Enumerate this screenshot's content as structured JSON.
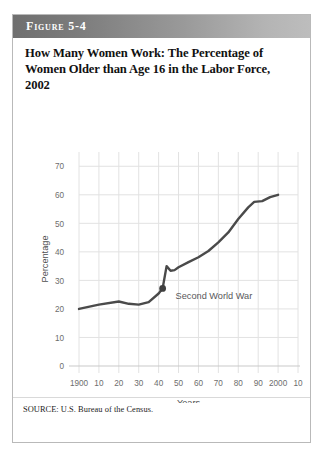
{
  "figure": {
    "number_label": "Figure 5-4",
    "title": "How Many Women Work: The Percentage of Women Older than Age 16 in the Labor Force, 2002",
    "source": "SOURCE: U.S. Bureau of the Census."
  },
  "chart_data": {
    "type": "line",
    "title": "How Many Women Work: The Percentage of Women Older than Age 16 in the Labor Force, 2002",
    "xlabel": "Years",
    "ylabel": "Percentage",
    "xlim": [
      1900,
      2010
    ],
    "ylim": [
      0,
      75
    ],
    "grid": true,
    "legend": false,
    "xtick_labels": [
      "1900",
      "10",
      "20",
      "30",
      "40",
      "50",
      "60",
      "70",
      "80",
      "90",
      "2000",
      "10"
    ],
    "xtick_values": [
      1900,
      1910,
      1920,
      1930,
      1940,
      1950,
      1960,
      1970,
      1980,
      1990,
      2000,
      2010
    ],
    "ytick_labels": [
      "0",
      "10",
      "20",
      "30",
      "40",
      "50",
      "60",
      "70"
    ],
    "ytick_values": [
      0,
      10,
      20,
      30,
      40,
      50,
      60,
      70
    ],
    "series": [
      {
        "name": "Percentage of women older than 16 in the labor force",
        "color": "#4a4a4a",
        "x": [
          1900,
          1910,
          1920,
          1925,
          1930,
          1935,
          1940,
          1942,
          1944,
          1946,
          1948,
          1950,
          1955,
          1960,
          1965,
          1970,
          1975,
          1980,
          1985,
          1988,
          1992,
          1996,
          2000
        ],
        "y": [
          20.0,
          21.5,
          22.6,
          21.8,
          21.5,
          22.4,
          25.4,
          27.2,
          35.0,
          33.4,
          33.6,
          34.6,
          36.4,
          38.1,
          40.3,
          43.3,
          46.8,
          51.5,
          55.6,
          57.5,
          57.8,
          59.2,
          60.0
        ]
      }
    ],
    "annotations": [
      {
        "text": "Second World War",
        "point_x": 1942,
        "point_y": 27.2,
        "marker": "dot",
        "marker_color": "#3f3f3f"
      }
    ]
  }
}
